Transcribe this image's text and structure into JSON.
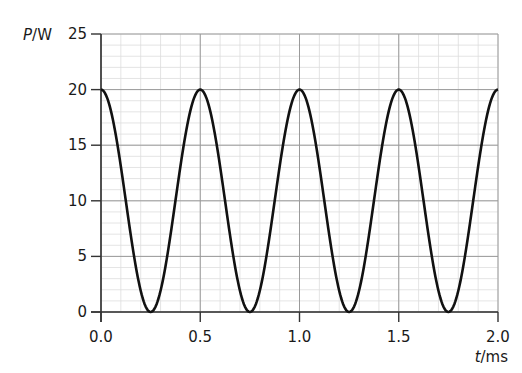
{
  "chart_data": {
    "type": "line",
    "title": "",
    "xlabel": "t/ms",
    "ylabel": "P/W",
    "xlabel_parts": {
      "symbol": "t",
      "unit": "/ms"
    },
    "ylabel_parts": {
      "symbol": "P",
      "unit": "/W"
    },
    "xlim": [
      0.0,
      2.0
    ],
    "ylim": [
      0,
      25
    ],
    "x_ticks": [
      "0.0",
      "0.5",
      "1.0",
      "1.5",
      "2.0"
    ],
    "y_ticks": [
      "0",
      "5",
      "10",
      "15",
      "20",
      "25"
    ],
    "grid": {
      "major_x": 0.5,
      "minor_x": 0.1,
      "major_y": 5,
      "minor_y": 1
    },
    "legend": null,
    "series": [
      {
        "name": "P",
        "description": "P = 10 + 10·cos(4πt), period 0.5 ms, max 20 W, min 0 W",
        "color": "#111111",
        "x": [
          0.0,
          0.125,
          0.25,
          0.375,
          0.5,
          0.625,
          0.75,
          0.875,
          1.0,
          1.125,
          1.25,
          1.375,
          1.5,
          1.625,
          1.75,
          1.875,
          2.0
        ],
        "y": [
          20,
          10,
          0,
          10,
          20,
          10,
          0,
          10,
          20,
          10,
          0,
          10,
          20,
          10,
          0,
          10,
          20
        ],
        "peaks_at": [
          0.0,
          0.5,
          1.0,
          1.5,
          2.0
        ],
        "troughs_at": [
          0.25,
          0.75,
          1.25,
          1.75
        ],
        "amplitude": 10,
        "offset": 10,
        "period_ms": 0.5
      }
    ]
  },
  "colors": {
    "curve": "#111111",
    "axis": "#333333",
    "major_grid": "#9a9a9a",
    "minor_grid": "#dddddd"
  }
}
